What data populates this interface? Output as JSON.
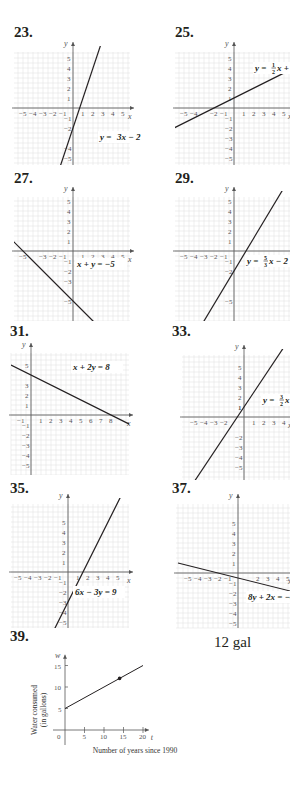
{
  "page": {
    "answer_39": "12 gal"
  },
  "chart_data": [
    {
      "id": "23",
      "label": "23.",
      "type": "line",
      "equation": "y = 3x − 2",
      "equation_parts": {
        "lhs": "y = ",
        "frac": null,
        "rhs": "3x − 2"
      },
      "xlabel": "x",
      "ylabel": "y",
      "xrange": [
        -5,
        5
      ],
      "yrange": [
        -5,
        5
      ],
      "x_ticks": [
        "−5",
        "−4",
        "−3",
        "−2",
        "−1",
        "1",
        "2",
        "3",
        "4",
        "5"
      ],
      "y_ticks": [
        "5",
        "4",
        "3",
        "2",
        "1",
        "−1",
        "−2",
        "−4",
        "−5"
      ],
      "slope": 3,
      "intercept": -2,
      "grid": true
    },
    {
      "id": "25",
      "label": "25.",
      "type": "line",
      "equation": "y = ½x + 1",
      "equation_parts": {
        "lhs": "y = ",
        "frac": [
          "1",
          "2"
        ],
        "rhs": "x + 1"
      },
      "xlabel": "x",
      "ylabel": "y",
      "xrange": [
        -5,
        5
      ],
      "yrange": [
        -5,
        5
      ],
      "x_ticks": [
        "−5",
        "−4",
        "−2",
        "−1",
        "1",
        "2",
        "3",
        "4",
        "5"
      ],
      "y_ticks": [
        "5",
        "4",
        "3",
        "2",
        "1",
        "−1",
        "−2",
        "−3",
        "−4",
        "−5"
      ],
      "slope": 0.5,
      "intercept": 1,
      "grid": true
    },
    {
      "id": "27",
      "label": "27.",
      "type": "line",
      "equation": "x + y = −5",
      "equation_parts": {
        "lhs": "",
        "frac": null,
        "rhs": "x + y = −5"
      },
      "xlabel": "x",
      "ylabel": "y",
      "xrange": [
        -5,
        5
      ],
      "yrange": [
        -5,
        5
      ],
      "x_ticks": [
        "−5",
        "−3",
        "−2",
        "−1",
        "1",
        "2",
        "3",
        "4",
        "5"
      ],
      "y_ticks": [
        "5",
        "4",
        "3",
        "2",
        "1",
        "−1",
        "−2",
        "−3",
        "−5"
      ],
      "slope": -1,
      "intercept": -5,
      "grid": true
    },
    {
      "id": "29",
      "label": "29.",
      "type": "line",
      "equation": "y = 5/3x − 2",
      "equation_parts": {
        "lhs": "y = ",
        "frac": [
          "5",
          "3"
        ],
        "rhs": "x − 2"
      },
      "xlabel": "x",
      "ylabel": "y",
      "xrange": [
        -5,
        5
      ],
      "yrange": [
        -5,
        5
      ],
      "x_ticks": [
        "−5",
        "−4",
        "−3",
        "−2",
        "−1",
        "2",
        "3",
        "4",
        "5"
      ],
      "y_ticks": [
        "5",
        "4",
        "3",
        "2",
        "1",
        "−1",
        "−2",
        "−5"
      ],
      "slope": 1.6667,
      "intercept": -2,
      "grid": true
    },
    {
      "id": "31",
      "label": "31.",
      "type": "line",
      "equation": "x + 2y = 8",
      "equation_parts": {
        "lhs": "",
        "frac": null,
        "rhs": "x + 2y = 8"
      },
      "xlabel": "x",
      "ylabel": "y",
      "xrange": [
        -1,
        9
      ],
      "yrange": [
        -5,
        5
      ],
      "x_ticks": [
        "−1",
        "1",
        "2",
        "3",
        "4",
        "5",
        "6",
        "7",
        "8"
      ],
      "y_ticks": [
        "5",
        "3",
        "2",
        "1",
        "−1",
        "−2",
        "−3",
        "−4",
        "−5"
      ],
      "slope": -0.5,
      "intercept": 4,
      "grid": true
    },
    {
      "id": "33",
      "label": "33.",
      "type": "line",
      "equation": "y = 3/2x + 1",
      "equation_parts": {
        "lhs": "y = ",
        "frac": [
          "3",
          "2"
        ],
        "rhs": "x + 1"
      },
      "xlabel": "x",
      "ylabel": "y",
      "xrange": [
        -5,
        5
      ],
      "yrange": [
        -5,
        5
      ],
      "x_ticks": [
        "−5",
        "−4",
        "−3",
        "−2",
        "1",
        "2",
        "3",
        "4",
        "5"
      ],
      "y_ticks": [
        "5",
        "4",
        "3",
        "2",
        "1",
        "1",
        "−2",
        "−3",
        "−4",
        "−5"
      ],
      "slope": 1.5,
      "intercept": 1,
      "grid": true
    },
    {
      "id": "35",
      "label": "35.",
      "type": "line",
      "equation": "6x − 3y = 9",
      "equation_parts": {
        "lhs": "",
        "frac": null,
        "rhs": "6x − 3y = 9"
      },
      "xlabel": "x",
      "ylabel": "y",
      "xrange": [
        -5,
        5
      ],
      "yrange": [
        -5,
        5
      ],
      "x_ticks": [
        "−5",
        "−4",
        "−3",
        "−2",
        "−1",
        "1",
        "2",
        "3",
        "4",
        "5"
      ],
      "y_ticks": [
        "5",
        "4",
        "3",
        "2",
        "1",
        "−1",
        "−2",
        "−3",
        "−4",
        "−5"
      ],
      "slope": 2,
      "intercept": -3,
      "grid": true
    },
    {
      "id": "37",
      "label": "37.",
      "type": "line",
      "equation": "8y + 2x = −4",
      "equation_parts": {
        "lhs": "",
        "frac": null,
        "rhs": "8y + 2x = −4"
      },
      "xlabel": "x",
      "ylabel": "y",
      "xrange": [
        -5,
        5
      ],
      "yrange": [
        -5,
        5
      ],
      "x_ticks": [
        "−5",
        "−4",
        "−3",
        "−2",
        "−1",
        "2",
        "3",
        "4",
        "5"
      ],
      "y_ticks": [
        "5",
        "4",
        "3",
        "2",
        "1",
        "−1",
        "−2",
        "−3",
        "−4",
        "−5"
      ],
      "slope": -0.25,
      "intercept": -0.5,
      "grid": true
    },
    {
      "id": "39",
      "label": "39.",
      "type": "line",
      "title": "",
      "xlabel": "Number of years since 1990",
      "ylabel": "Water consumed (in gallons)",
      "ylabel_lines": [
        "Water consumed",
        "(in gallons)"
      ],
      "x_axis_var": "t",
      "y_axis_var": "w",
      "xrange": [
        0,
        20
      ],
      "yrange": [
        0,
        15
      ],
      "x_ticks": [
        "0",
        "5",
        "10",
        "15",
        "20"
      ],
      "y_ticks": [
        "5",
        "10",
        "15"
      ],
      "x": [
        0,
        20
      ],
      "y": [
        5,
        15
      ],
      "highlight_point": {
        "x": 14,
        "y": 12
      },
      "grid": false
    }
  ]
}
